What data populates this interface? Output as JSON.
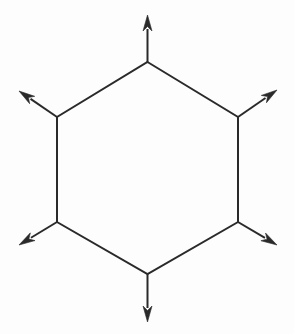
{
  "figure": {
    "canvas": {
      "width": 294,
      "height": 334,
      "background_color": "#fdfdfd"
    },
    "style": {
      "stroke_color": "#2a2a2a",
      "stroke_width": 2,
      "fill_color": "#fdfdfd",
      "arrowhead_color": "#2a2a2a",
      "arrowhead_length": 16,
      "arrowhead_half_width": 4.5
    },
    "shape": {
      "name": "hexagon",
      "orientation": "pointy-top",
      "sides": 6,
      "center": {
        "x": 147.5,
        "y": 168
      },
      "vertices": [
        {
          "label": "top",
          "x": 147.5,
          "y": 62
        },
        {
          "label": "upper-right",
          "x": 238,
          "y": 117
        },
        {
          "label": "lower-right",
          "x": 238,
          "y": 222
        },
        {
          "label": "bottom",
          "x": 147.5,
          "y": 274
        },
        {
          "label": "lower-left",
          "x": 57,
          "y": 222
        },
        {
          "label": "upper-left",
          "x": 57,
          "y": 117
        }
      ]
    },
    "arrows": [
      {
        "label": "arrow-up",
        "direction": "up",
        "from_vertex": "top",
        "start": {
          "x": 147.5,
          "y": 62
        },
        "tip": {
          "x": 147.5,
          "y": 15
        }
      },
      {
        "label": "arrow-upper-right",
        "direction": "upper-right",
        "from_vertex": "upper-right",
        "start": {
          "x": 238,
          "y": 117
        },
        "tip": {
          "x": 277,
          "y": 90
        }
      },
      {
        "label": "arrow-lower-right",
        "direction": "lower-right",
        "from_vertex": "lower-right",
        "start": {
          "x": 238,
          "y": 222
        },
        "tip": {
          "x": 277,
          "y": 245
        }
      },
      {
        "label": "arrow-down",
        "direction": "down",
        "from_vertex": "bottom",
        "start": {
          "x": 147.5,
          "y": 274
        },
        "tip": {
          "x": 147.5,
          "y": 322
        }
      },
      {
        "label": "arrow-lower-left",
        "direction": "lower-left",
        "from_vertex": "lower-left",
        "start": {
          "x": 57,
          "y": 222
        },
        "tip": {
          "x": 19,
          "y": 245
        }
      },
      {
        "label": "arrow-upper-left",
        "direction": "upper-left",
        "from_vertex": "upper-left",
        "start": {
          "x": 57,
          "y": 117
        },
        "tip": {
          "x": 19,
          "y": 91
        }
      }
    ]
  }
}
